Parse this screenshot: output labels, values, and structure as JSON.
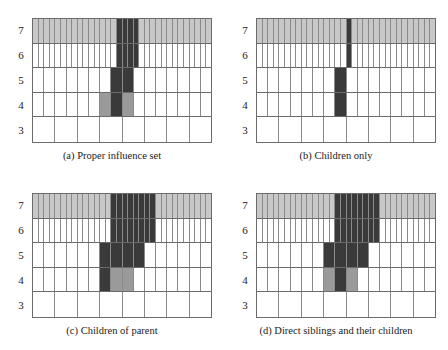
{
  "figure": {
    "type": "hierarchical-grid-diagram",
    "background": "#ffffff",
    "rows_top_to_bottom": [
      7,
      6,
      5,
      4,
      3
    ],
    "cells_per_row": {
      "7": 32,
      "6": 32,
      "5": 16,
      "4": 16,
      "3": 8
    },
    "colors": {
      "dark_highlight": "#3a3a3a",
      "medium_highlight": "#9a9a9a",
      "row_tint": "#c8c8c8",
      "empty": "#ffffff",
      "cell_border": "#8a8a8a",
      "row_border": "#6b6b6b",
      "text": "#1a1a1a"
    },
    "row_tint_applied_to": [
      7
    ]
  },
  "panels": [
    {
      "id": "a",
      "caption": "(a) Proper influence set",
      "axis_labels": [
        "7",
        "6",
        "5",
        "4",
        "3"
      ],
      "highlights": {
        "7": {
          "dark": [
            [
              16,
              19
            ]
          ],
          "medium": []
        },
        "6": {
          "dark": [
            [
              16,
              19
            ]
          ],
          "medium": []
        },
        "5": {
          "dark": [
            [
              8,
              9
            ]
          ],
          "medium": []
        },
        "4": {
          "dark": [
            [
              8,
              8
            ]
          ],
          "medium": [
            [
              7,
              7
            ],
            [
              9,
              9
            ]
          ]
        },
        "3": {
          "dark": [],
          "medium": []
        }
      }
    },
    {
      "id": "b",
      "caption": "(b) Children only",
      "axis_labels": [
        "7",
        "6",
        "5",
        "4",
        "3"
      ],
      "highlights": {
        "7": {
          "dark": [
            [
              17,
              17
            ]
          ],
          "medium": []
        },
        "6": {
          "dark": [
            [
              17,
              17
            ]
          ],
          "medium": []
        },
        "5": {
          "dark": [
            [
              8,
              8
            ]
          ],
          "medium": []
        },
        "4": {
          "dark": [
            [
              8,
              8
            ]
          ],
          "medium": []
        },
        "3": {
          "dark": [],
          "medium": []
        }
      }
    },
    {
      "id": "c",
      "caption": "(c) Children of parent",
      "axis_labels": [
        "7",
        "6",
        "5",
        "4",
        "3"
      ],
      "highlights": {
        "7": {
          "dark": [
            [
              15,
              22
            ]
          ],
          "medium": []
        },
        "6": {
          "dark": [
            [
              15,
              22
            ]
          ],
          "medium": []
        },
        "5": {
          "dark": [
            [
              7,
              10
            ]
          ],
          "medium": []
        },
        "4": {
          "dark": [
            [
              7,
              7
            ]
          ],
          "medium": [
            [
              8,
              9
            ]
          ]
        },
        "3": {
          "dark": [],
          "medium": []
        }
      }
    },
    {
      "id": "d",
      "caption": "(d) Direct siblings and their children",
      "axis_labels": [
        "7",
        "6",
        "5",
        "4",
        "3"
      ],
      "highlights": {
        "7": {
          "dark": [
            [
              15,
              22
            ]
          ],
          "medium": []
        },
        "6": {
          "dark": [
            [
              15,
              22
            ]
          ],
          "medium": []
        },
        "5": {
          "dark": [
            [
              7,
              10
            ]
          ],
          "medium": []
        },
        "4": {
          "dark": [
            [
              8,
              8
            ]
          ],
          "medium": [
            [
              7,
              7
            ],
            [
              9,
              9
            ]
          ]
        },
        "3": {
          "dark": [],
          "medium": []
        }
      }
    }
  ]
}
